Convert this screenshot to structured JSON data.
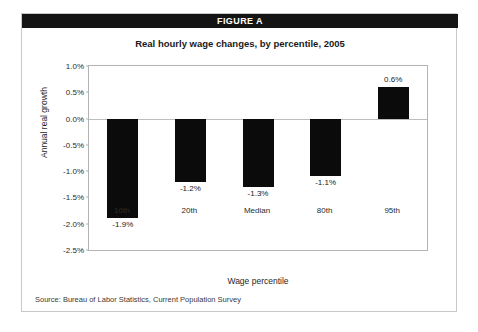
{
  "figure": {
    "banner_label": "FIGURE A",
    "banner_color": "#141414",
    "banner_text_color": "#ffffff",
    "source_note": "Source:  Bureau of Labor Statistics, Current Population Survey"
  },
  "chart_data": {
    "type": "bar",
    "title": "Real hourly wage changes, by percentile, 2005",
    "xlabel": "Wage percentile",
    "ylabel": "Annual real growth",
    "categories": [
      "10th",
      "20th",
      "Median",
      "80th",
      "95th"
    ],
    "values": [
      -1.9,
      -1.2,
      -1.3,
      -1.1,
      0.6
    ],
    "value_labels": [
      "-1.9%",
      "-1.2%",
      "-1.3%",
      "-1.1%",
      "0.6%"
    ],
    "ylim": [
      -2.5,
      1.0
    ],
    "ytick_values": [
      1.0,
      0.5,
      0.0,
      -0.5,
      -1.0,
      -1.5,
      -2.0,
      -2.5
    ],
    "ytick_labels": [
      "1.0%",
      "0.5%",
      "0.0%",
      "-0.5%",
      "-1.0%",
      "-1.5%",
      "-2.0%",
      "-2.5%"
    ],
    "grid": false,
    "legend": "none",
    "bar_color": "#0b0b0b",
    "zero_line_color": "#bdbdbd"
  }
}
